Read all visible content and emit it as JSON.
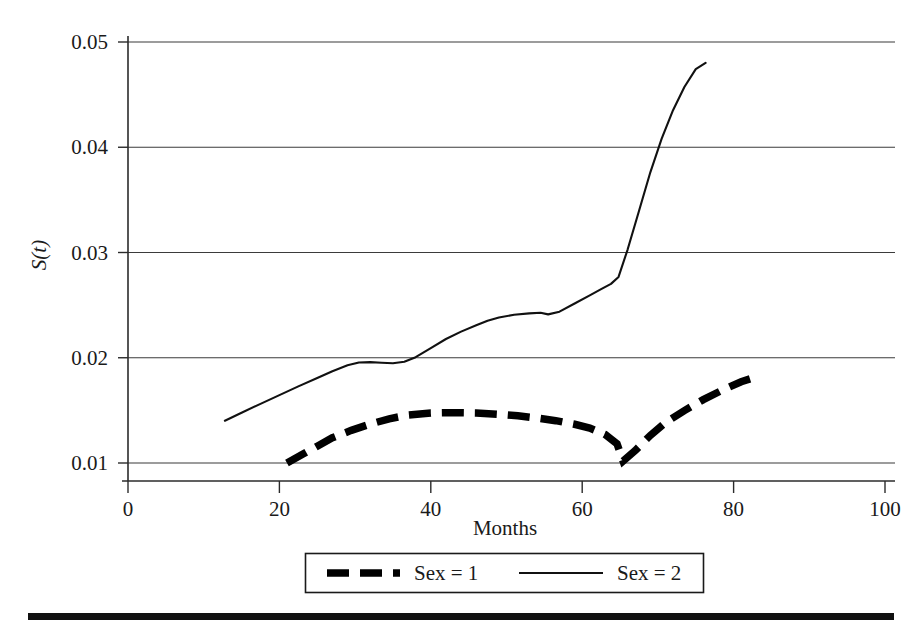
{
  "chart_data": {
    "type": "line",
    "title": "",
    "xlabel": "Months",
    "ylabel": "S(t)",
    "ylabel_base": "S(",
    "ylabel_italic": "t",
    "ylabel_close": ")",
    "xlim": [
      0,
      100
    ],
    "ylim": [
      0.01,
      0.05
    ],
    "xticks": [
      0,
      20,
      40,
      60,
      80,
      100
    ],
    "xtick_labels": [
      "0",
      "20",
      "40",
      "60",
      "80",
      "100"
    ],
    "yticks": [
      0.01,
      0.02,
      0.03,
      0.04,
      0.05
    ],
    "ytick_labels": [
      "0.01",
      "0.02",
      "0.03",
      "0.04",
      "0.05"
    ],
    "grid": "horizontal",
    "legend_position": "below-axes",
    "series": [
      {
        "name": "Sex = 1",
        "style": "dashed",
        "linewidth": "thick",
        "color": "#000000",
        "x": [
          21.0,
          23.0,
          25.0,
          27.0,
          29.5,
          32.0,
          34.5,
          37.0,
          40.0,
          43.0,
          46.0,
          49.0,
          51.5,
          54.0,
          56.5,
          59.0,
          61.0,
          63.0,
          64.6,
          65.4,
          67.0,
          69.0,
          71.0,
          73.5,
          76.0,
          78.5,
          81.0,
          83.4
        ],
        "y": [
          0.01,
          0.0108,
          0.0116,
          0.0124,
          0.0131,
          0.0137,
          0.0142,
          0.01455,
          0.01475,
          0.01478,
          0.01475,
          0.01462,
          0.01448,
          0.01428,
          0.01402,
          0.01368,
          0.01332,
          0.01272,
          0.01182,
          0.01018,
          0.01118,
          0.01262,
          0.01385,
          0.01498,
          0.01602,
          0.01692,
          0.01772,
          0.01828
        ]
      },
      {
        "name": "Sex = 2",
        "style": "solid",
        "linewidth": "thin",
        "color": "#111111",
        "x": [
          12.8,
          15.0,
          17.5,
          20.0,
          22.5,
          25.0,
          27.0,
          29.0,
          30.5,
          32.0,
          33.5,
          35.0,
          36.5,
          38.0,
          40.0,
          42.0,
          44.0,
          46.0,
          47.5,
          49.0,
          51.0,
          53.0,
          54.5,
          55.5,
          57.0,
          59.0,
          61.0,
          62.5,
          63.8,
          64.8,
          66.0,
          67.5,
          69.0,
          70.5,
          72.0,
          73.5,
          75.0,
          76.3
        ],
        "y": [
          0.01402,
          0.01478,
          0.01562,
          0.01645,
          0.01728,
          0.01808,
          0.01872,
          0.01928,
          0.01955,
          0.01958,
          0.01952,
          0.01948,
          0.01962,
          0.02005,
          0.02092,
          0.02178,
          0.02248,
          0.02308,
          0.02352,
          0.02382,
          0.02408,
          0.02422,
          0.02428,
          0.02412,
          0.02438,
          0.02515,
          0.02592,
          0.02652,
          0.02702,
          0.02768,
          0.03028,
          0.03395,
          0.03762,
          0.04082,
          0.04352,
          0.04572,
          0.04742,
          0.04802
        ]
      }
    ]
  },
  "legend": {
    "entries": [
      {
        "label": "Sex = 1",
        "style": "dashed"
      },
      {
        "label": "Sex = 2",
        "style": "solid"
      }
    ]
  },
  "axes": {
    "x_label": "Months",
    "y_label": "S(t)"
  }
}
